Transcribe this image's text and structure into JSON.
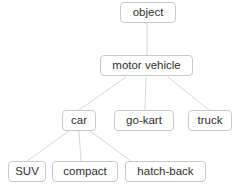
{
  "diagram": {
    "type": "taxonomy-tree",
    "background_color": "#ffffff",
    "node_border_color": "#c9c9c9",
    "node_text_color": "#2f2f2f",
    "edge_color": "#d8d8d8",
    "nodes": [
      {
        "id": "object",
        "label": "object",
        "level": 0
      },
      {
        "id": "motor_vehicle",
        "label": "motor vehicle",
        "level": 1
      },
      {
        "id": "car",
        "label": "car",
        "level": 2
      },
      {
        "id": "go_kart",
        "label": "go-kart",
        "level": 2
      },
      {
        "id": "truck",
        "label": "truck",
        "level": 2
      },
      {
        "id": "suv",
        "label": "SUV",
        "level": 3
      },
      {
        "id": "compact",
        "label": "compact",
        "level": 3
      },
      {
        "id": "hatch_back",
        "label": "hatch-back",
        "level": 3
      }
    ],
    "edges": [
      {
        "from": "object",
        "to": "motor_vehicle"
      },
      {
        "from": "motor_vehicle",
        "to": "car"
      },
      {
        "from": "motor_vehicle",
        "to": "go_kart"
      },
      {
        "from": "motor_vehicle",
        "to": "truck"
      },
      {
        "from": "car",
        "to": "suv"
      },
      {
        "from": "car",
        "to": "compact"
      },
      {
        "from": "car",
        "to": "hatch_back"
      }
    ]
  }
}
